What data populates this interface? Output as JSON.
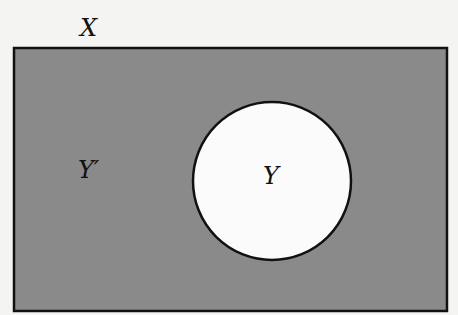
{
  "diagram": {
    "type": "venn",
    "universal_set": {
      "label": "X",
      "fill": "#8a8a8a"
    },
    "subset": {
      "label": "Y",
      "fill": "#fbfbfb"
    },
    "complement": {
      "label": "Y′"
    },
    "stroke": "#111111",
    "background": "#f4f4f2"
  }
}
